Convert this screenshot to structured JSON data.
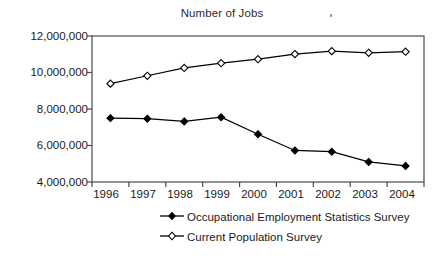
{
  "chart_data": {
    "type": "line",
    "title": "Number of Jobs",
    "xlabel": "",
    "ylabel": "",
    "categories": [
      "1996",
      "1997",
      "1998",
      "1999",
      "2000",
      "2001",
      "2002",
      "2003",
      "2004"
    ],
    "ylim": [
      4000000,
      12000000
    ],
    "ytick_values": [
      4000000,
      6000000,
      8000000,
      10000000,
      12000000
    ],
    "ytick_labels": [
      "4,000,000",
      "6,000,000",
      "8,000,000",
      "10,000,000",
      "12,000,000"
    ],
    "grid": false,
    "legend_position": "bottom",
    "series": [
      {
        "name": "Occupational Employment Statistics Survey",
        "marker": "filled-diamond",
        "color": "#000000",
        "values": [
          7500000,
          7470000,
          7320000,
          7550000,
          6620000,
          5730000,
          5660000,
          5100000,
          4880000
        ]
      },
      {
        "name": "Current Population Survey",
        "marker": "open-diamond",
        "color": "#000000",
        "values": [
          9390000,
          9820000,
          10250000,
          10510000,
          10730000,
          11010000,
          11170000,
          11080000,
          11140000
        ]
      }
    ]
  },
  "axis": {
    "y_labels": [
      "12,000,000",
      "10,000,000",
      "8,000,000",
      "6,000,000",
      "4,000,000"
    ],
    "x_labels": [
      "1996",
      "1997",
      "1998",
      "1999",
      "2000",
      "2001",
      "2002",
      "2003",
      "2004"
    ]
  },
  "legend": {
    "items": [
      {
        "label": "Occupational Employment Statistics Survey",
        "marker": "filled-diamond"
      },
      {
        "label": "Current Population Survey",
        "marker": "open-diamond"
      }
    ]
  },
  "colors": {
    "ink": "#000000",
    "frame": "#4a4a4a",
    "background": "#ffffff"
  }
}
